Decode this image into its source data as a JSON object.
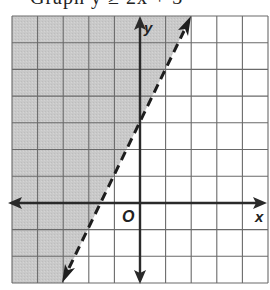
{
  "header": {
    "clipped_text": "Graph y ≥ 2x + 3"
  },
  "graph": {
    "x_label": "x",
    "y_label": "y",
    "origin_label": "O",
    "grid": {
      "cols": 10,
      "rows": 10,
      "x_min": -5,
      "x_max": 5,
      "y_min": -3,
      "y_max": 7
    },
    "boundary_line": {
      "equation": "y = 2x + 3",
      "slope": 2,
      "intercept": 3,
      "style": "dashed",
      "points": [
        [
          -3,
          -3
        ],
        [
          2,
          7
        ]
      ]
    },
    "shaded_region": "left of line (y > 2x + 3)",
    "colors": {
      "shade": "#c9c9c9",
      "grid_line": "#6a6a6a",
      "axis": "#2a2a2a",
      "boundary": "#1e1e1e"
    }
  }
}
